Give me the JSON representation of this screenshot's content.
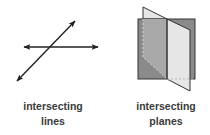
{
  "figures": [
    {
      "id": "lines",
      "label_line1": "intersecting",
      "label_line2": "lines",
      "stroke_color": "#222222"
    },
    {
      "id": "planes",
      "label_line1": "intersecting",
      "label_line2": "planes",
      "back_plane_color": "#8a8a8a",
      "front_plane_color": "#e6e6e6",
      "front_plane_hidden_color": "#b4b4b4",
      "edge_color": "#333333"
    }
  ]
}
